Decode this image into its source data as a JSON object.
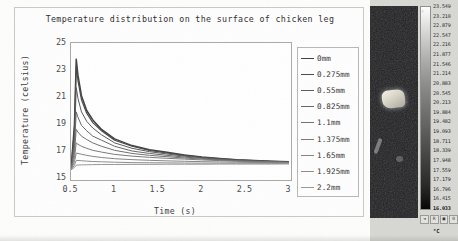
{
  "chart_data": {
    "type": "line",
    "title": "Temperature distribution on the surface of chicken leg",
    "xlabel": "Time (s)",
    "ylabel": "Temperature (celsius)",
    "xlim": [
      0.5,
      3
    ],
    "ylim": [
      15,
      25
    ],
    "xticks": [
      "0.5",
      "1",
      "1.5",
      "2",
      "2.5",
      "3"
    ],
    "yticks": [
      "15",
      "17",
      "19",
      "21",
      "23",
      "25"
    ],
    "grid": false,
    "legend_position": "right-outside",
    "x": [
      0.5,
      0.54,
      0.56,
      0.58,
      0.62,
      0.68,
      0.75,
      0.85,
      1.0,
      1.2,
      1.4,
      1.6,
      1.8,
      2.0,
      2.2,
      2.4,
      2.6,
      2.8,
      3.0
    ],
    "series": [
      {
        "name": "0mm",
        "color": "#3f3f3f",
        "width": 1.5,
        "values": [
          15.6,
          19.0,
          23.8,
          22.6,
          21.1,
          20.0,
          19.3,
          18.6,
          17.9,
          17.4,
          17.1,
          16.9,
          16.7,
          16.55,
          16.45,
          16.35,
          16.3,
          16.25,
          16.2
        ]
      },
      {
        "name": "0.275mm",
        "color": "#4a4a4a",
        "width": 1.2,
        "values": [
          15.6,
          18.6,
          23.3,
          22.2,
          20.8,
          19.8,
          19.1,
          18.5,
          17.8,
          17.35,
          17.05,
          16.85,
          16.68,
          16.53,
          16.43,
          16.34,
          16.29,
          16.24,
          16.19
        ]
      },
      {
        "name": "0.55mm",
        "color": "#595959",
        "width": 1.0,
        "values": [
          15.6,
          17.9,
          21.7,
          20.9,
          19.9,
          19.2,
          18.7,
          18.2,
          17.6,
          17.2,
          16.95,
          16.78,
          16.62,
          16.5,
          16.4,
          16.32,
          16.27,
          16.22,
          16.18
        ]
      },
      {
        "name": "0.825mm",
        "color": "#666666",
        "width": 1.0,
        "values": [
          15.6,
          17.3,
          19.9,
          19.5,
          18.9,
          18.5,
          18.1,
          17.8,
          17.35,
          17.0,
          16.82,
          16.68,
          16.55,
          16.45,
          16.36,
          16.29,
          16.24,
          16.2,
          16.16
        ]
      },
      {
        "name": "1.1mm",
        "color": "#707070",
        "width": 1.0,
        "values": [
          15.6,
          16.9,
          18.6,
          18.4,
          18.1,
          17.85,
          17.6,
          17.35,
          17.05,
          16.82,
          16.68,
          16.58,
          16.48,
          16.4,
          16.33,
          16.27,
          16.22,
          16.18,
          16.15
        ]
      },
      {
        "name": "1.375mm",
        "color": "#7a7a7a",
        "width": 1.0,
        "values": [
          15.6,
          16.5,
          17.6,
          17.5,
          17.35,
          17.2,
          17.05,
          16.92,
          16.75,
          16.62,
          16.53,
          16.46,
          16.4,
          16.34,
          16.29,
          16.24,
          16.2,
          16.17,
          16.14
        ]
      },
      {
        "name": "1.65mm",
        "color": "#848484",
        "width": 1.0,
        "values": [
          15.6,
          16.2,
          16.85,
          16.82,
          16.76,
          16.68,
          16.6,
          16.52,
          16.43,
          16.36,
          16.31,
          16.27,
          16.24,
          16.21,
          16.19,
          16.17,
          16.15,
          16.13,
          16.12
        ]
      },
      {
        "name": "1.925mm",
        "color": "#8d8d8d",
        "width": 1.0,
        "values": [
          15.6,
          15.95,
          16.3,
          16.3,
          16.28,
          16.25,
          16.22,
          16.2,
          16.17,
          16.14,
          16.13,
          16.12,
          16.11,
          16.1,
          16.1,
          16.09,
          16.09,
          16.08,
          16.08
        ]
      },
      {
        "name": "2.2mm",
        "color": "#979797",
        "width": 1.0,
        "values": [
          15.6,
          15.78,
          15.95,
          15.96,
          15.97,
          15.98,
          15.99,
          16.0,
          16.0,
          16.01,
          16.01,
          16.02,
          16.02,
          16.02,
          16.03,
          16.03,
          16.03,
          16.03,
          16.04
        ]
      }
    ]
  },
  "legend": {
    "items": [
      {
        "label": "0mm"
      },
      {
        "label": "0.275mm"
      },
      {
        "label": "0.55mm"
      },
      {
        "label": "0.825mm"
      },
      {
        "label": "1.1mm"
      },
      {
        "label": "1.375mm"
      },
      {
        "label": "1.65mm"
      },
      {
        "label": "1.925mm"
      },
      {
        "label": "2.2mm"
      }
    ]
  },
  "thermal": {
    "unit": "°C",
    "scale_values": [
      "23.549",
      "23.210",
      "22.879",
      "22.547",
      "22.216",
      "21.877",
      "21.546",
      "21.214",
      "20.883",
      "20.545",
      "20.213",
      "19.884",
      "19.482",
      "19.093",
      "18.711",
      "18.339",
      "17.948",
      "17.559",
      "17.179",
      "16.796",
      "16.415",
      "16.033"
    ],
    "scale_max": "23.549",
    "scale_min": "16.033",
    "toolbar_buttons": [
      "◄",
      "R",
      "■",
      "0"
    ],
    "caret": "▲"
  }
}
